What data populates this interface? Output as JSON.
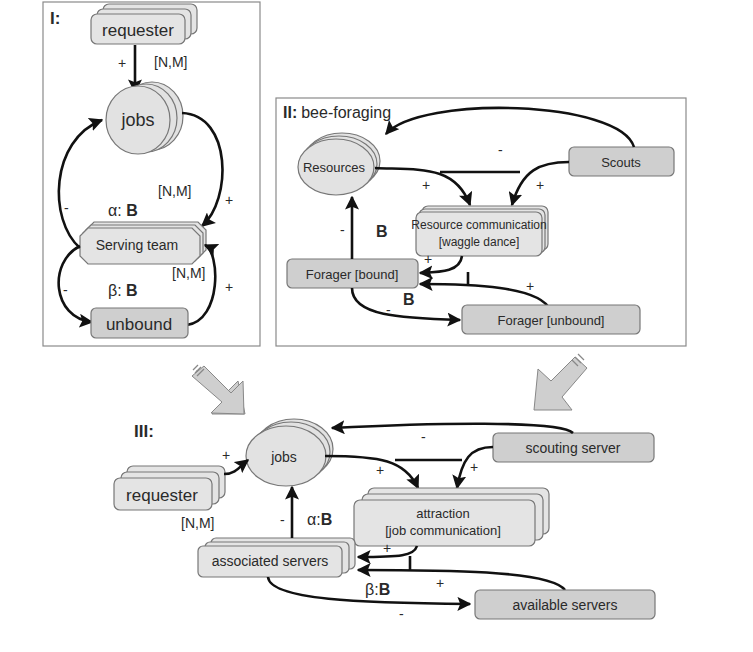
{
  "panel_I": {
    "title": "I:",
    "nodes": {
      "requester": "requester",
      "jobs": "jobs",
      "serving_team": "Serving team",
      "unbound": "unbound"
    },
    "labels": {
      "nm_requester": "[N,M]",
      "nm_jobs": "[N,M]",
      "nm_team": "[N,M]",
      "plus_requester": "+",
      "alpha": "α: B",
      "beta": "β: B",
      "minus_left_top": "-",
      "plus_right_top": "+",
      "minus_left_bottom": "-",
      "plus_right_bottom": "+"
    }
  },
  "panel_II": {
    "title": "II:",
    "subtitle": "bee-foraging",
    "nodes": {
      "resources": "Resources",
      "scouts": "Scouts",
      "resource_comm_line1": "Resource communication",
      "resource_comm_line2": "[waggle dance]",
      "forager_bound": "Forager [bound]",
      "forager_unbound": "Forager [unbound]"
    },
    "labels": {
      "minus_scouts_resources": "-",
      "plus_resources_comm": "+",
      "plus_scouts_comm": "+",
      "minus_bound_resources": "-",
      "b_bound_resources": "B",
      "plus_comm_bound": "+",
      "plus_unbound_bound": "+",
      "minus_bound_unbound": "-",
      "b_bound_unbound": "B"
    }
  },
  "panel_III": {
    "title": "III:",
    "nodes": {
      "jobs": "jobs",
      "requester": "requester",
      "scouting_server": "scouting server",
      "attraction_line1": "attraction",
      "attraction_line2": "[job communication]",
      "associated_servers": "associated servers",
      "available_servers": "available servers"
    },
    "labels": {
      "plus_requester_jobs": "+",
      "nm_requester": "[N,M]",
      "minus_scouting_jobs": "-",
      "plus_jobs_attraction": "+",
      "plus_scouting_attraction": "+",
      "minus_assoc_jobs": "-",
      "alpha": "α:B",
      "plus_attraction_assoc": "+",
      "plus_available_assoc": "+",
      "beta": "β:B",
      "minus_assoc_available": "-"
    }
  },
  "colors": {
    "node_fill": "#e4e4e4",
    "node_dark_fill": "#cfcfcf",
    "edge": "#111111",
    "panel_border": "#8a8a8a",
    "arrow_fill": "#cfcfcf"
  }
}
